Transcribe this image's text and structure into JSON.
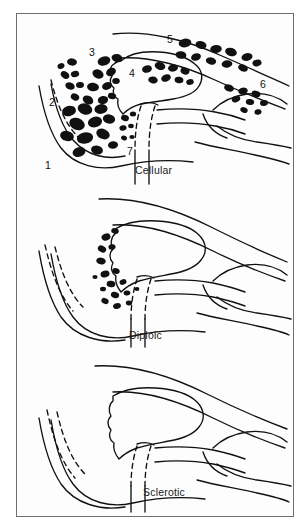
{
  "figure": {
    "border_color": "#6e6e72",
    "ink_color": "#111111",
    "background_color": "#ffffff",
    "panel_count": 3
  },
  "panels": [
    {
      "id": "cellular",
      "caption": "Cellular",
      "caption_x": 118,
      "caption_y": 150,
      "has_air_cells": true,
      "air_cell_count": 62,
      "labels": [
        {
          "text": "1",
          "x": 28,
          "y": 146
        },
        {
          "text": "2",
          "x": 32,
          "y": 83
        },
        {
          "text": "3",
          "x": 72,
          "y": 33
        },
        {
          "text": "4",
          "x": 112,
          "y": 54
        },
        {
          "text": "5",
          "x": 150,
          "y": 20
        },
        {
          "text": "6",
          "x": 243,
          "y": 65
        },
        {
          "text": "7",
          "x": 110,
          "y": 132
        }
      ]
    },
    {
      "id": "diploic",
      "caption": "Diploic",
      "caption_x": 112,
      "caption_y": 140,
      "has_air_cells": true,
      "air_cell_count": 17,
      "labels": []
    },
    {
      "id": "sclerotic",
      "caption": "Sclerotic",
      "caption_x": 126,
      "caption_y": 132,
      "has_air_cells": false,
      "air_cell_count": 0,
      "labels": []
    }
  ],
  "legend_keys": [
    {
      "number": "1",
      "meaning": "1"
    },
    {
      "number": "2",
      "meaning": "2"
    },
    {
      "number": "3",
      "meaning": "3"
    },
    {
      "number": "4",
      "meaning": "4"
    },
    {
      "number": "5",
      "meaning": "5"
    },
    {
      "number": "6",
      "meaning": "6"
    },
    {
      "number": "7",
      "meaning": "7"
    }
  ]
}
